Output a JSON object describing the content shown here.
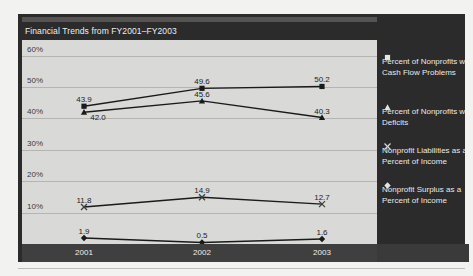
{
  "chart": {
    "title": "Financial Trends from FY2001–FY2003",
    "accent_panel_color": "#2b2b2b",
    "plot_bg_color": "#d9d9d7"
  },
  "yaxis": {
    "ticks": [
      "60%",
      "50%",
      "40%",
      "30%",
      "20%",
      "10%"
    ]
  },
  "xaxis": {
    "ticks": [
      "2001",
      "2002",
      "2003"
    ]
  },
  "legend": {
    "items": [
      {
        "marker": "square-marker",
        "label": "Percent of Nonprofits with Cash Flow Problems"
      },
      {
        "marker": "triangle-marker",
        "label": "Percent of Nonprofits with Deficits"
      },
      {
        "marker": "x-marker",
        "label": "Nonprofit Liabilities as a Percent of Income"
      },
      {
        "marker": "diamond-marker",
        "label": "Nonprofit Surplus as a Percent of Income"
      }
    ]
  },
  "chart_data": {
    "type": "line",
    "title": "Financial Trends from FY2001–FY2003",
    "xlabel": "",
    "ylabel": "",
    "categories": [
      "2001",
      "2002",
      "2003"
    ],
    "ylim": [
      0,
      65
    ],
    "ytick_values": [
      60,
      50,
      40,
      30,
      20,
      10
    ],
    "ytick_labels": [
      "60%",
      "50%",
      "40%",
      "30%",
      "20%",
      "10%"
    ],
    "grid": true,
    "legend_position": "right",
    "series": [
      {
        "name": "Percent of Nonprofits with Cash Flow Problems",
        "marker": "square",
        "values": [
          43.9,
          49.6,
          50.2
        ],
        "labels": [
          "43.9",
          "49.6",
          "50.2"
        ]
      },
      {
        "name": "Percent of Nonprofits with Deficits",
        "marker": "triangle",
        "values": [
          42.0,
          45.6,
          40.3
        ],
        "labels": [
          "42.0",
          "45.6",
          "40.3"
        ]
      },
      {
        "name": "Nonprofit Liabilities as a Percent of Income",
        "marker": "x",
        "values": [
          11.8,
          14.9,
          12.7
        ],
        "labels": [
          "11.8",
          "14.9",
          "12.7"
        ]
      },
      {
        "name": "Nonprofit Surplus as a Percent of Income",
        "marker": "diamond",
        "values": [
          1.9,
          0.5,
          1.6
        ],
        "labels": [
          "1.9",
          "0.5",
          "1.6"
        ]
      }
    ]
  }
}
